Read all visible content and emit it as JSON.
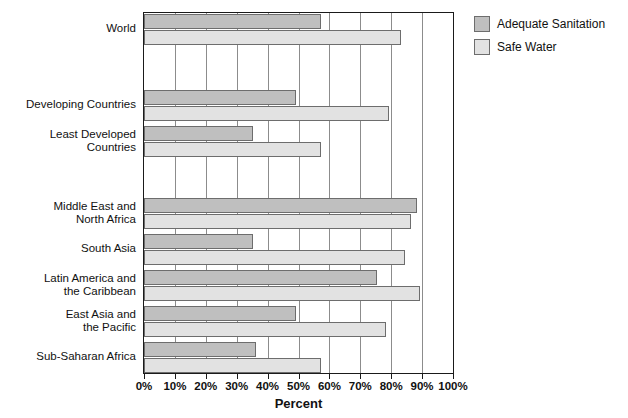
{
  "chart_data": {
    "type": "bar",
    "orientation": "horizontal",
    "title": "",
    "xlabel": "Percent",
    "ylabel": "",
    "xlim": [
      0,
      100
    ],
    "xticks": [
      "0%",
      "10%",
      "20%",
      "30%",
      "40%",
      "50%",
      "60%",
      "70%",
      "80%",
      "90%",
      "100%"
    ],
    "xtick_values": [
      0,
      10,
      20,
      30,
      40,
      50,
      60,
      70,
      80,
      90,
      100
    ],
    "grid": true,
    "grid_axis": "x",
    "legend_position": "right-top",
    "categories": [
      "World",
      "Developing Countries",
      "Least Developed\nCountries",
      "Middle East and\nNorth Africa",
      "South Asia",
      "Latin America and\nthe Caribbean",
      "East Asia and\nthe Pacific",
      "Sub-Saharan Africa"
    ],
    "series": [
      {
        "name": "Adequate Sanitation",
        "color": "#bfbfbf",
        "values": [
          57,
          49,
          35,
          88,
          35,
          75,
          49,
          36
        ]
      },
      {
        "name": "Safe Water",
        "color": "#e2e2e2",
        "values": [
          83,
          79,
          57,
          86,
          84,
          89,
          78,
          57
        ]
      }
    ],
    "group_rows": [
      {
        "label": "World",
        "top": 1,
        "sanitation": 57,
        "water": 83
      },
      {
        "label": "Developing Countries",
        "top": 77,
        "sanitation": 49,
        "water": 79
      },
      {
        "label": "Least Developed\nCountries",
        "top": 113,
        "sanitation": 35,
        "water": 57
      },
      {
        "label": "Middle East and\nNorth Africa",
        "top": 185,
        "sanitation": 88,
        "water": 86
      },
      {
        "label": "South Asia",
        "top": 221,
        "sanitation": 35,
        "water": 84
      },
      {
        "label": "Latin America and\nthe Caribbean",
        "top": 257,
        "sanitation": 75,
        "water": 89
      },
      {
        "label": "East Asia and\nthe Pacific",
        "top": 293,
        "sanitation": 49,
        "water": 78
      },
      {
        "label": "Sub-Saharan Africa",
        "top": 329,
        "sanitation": 36,
        "water": 57
      }
    ]
  },
  "legend": {
    "items": [
      {
        "label": "Adequate Sanitation",
        "swatch": "sanitation"
      },
      {
        "label": "Safe Water",
        "swatch": "water"
      }
    ]
  },
  "axis": {
    "x_title": "Percent"
  },
  "colors": {
    "sanitation_fill": "#bfbfbf",
    "water_fill": "#e2e2e2",
    "bar_stroke": "#6d6d6d",
    "grid": "#8c8c8c",
    "frame": "#1a1a1a",
    "text": "#111111",
    "background": "#ffffff"
  }
}
